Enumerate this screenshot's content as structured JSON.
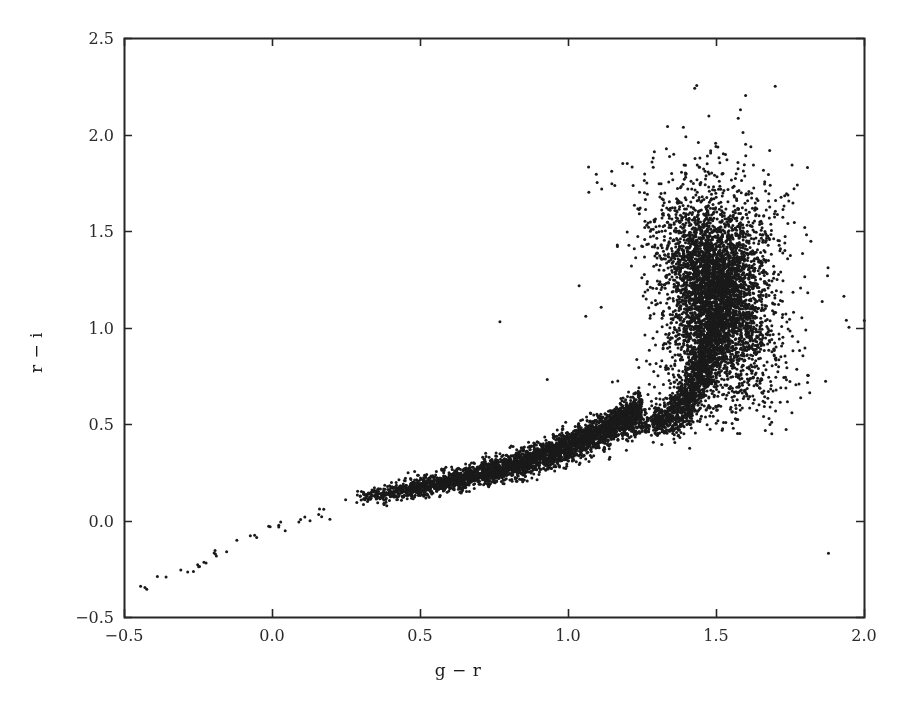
{
  "figure": {
    "background_color": "#ffffff",
    "axes_color": "#262626",
    "marker_color": "#1a1a1a",
    "plot_box": {
      "left": 124,
      "top": 38,
      "right": 864,
      "bottom": 617
    }
  },
  "chart_data": {
    "type": "scatter",
    "title": "",
    "subtitle": "",
    "xlabel": "g − r",
    "ylabel": "r − i",
    "xlim": [
      -0.5,
      2.0
    ],
    "ylim": [
      -0.5,
      2.5
    ],
    "xticks": [
      -0.5,
      0.0,
      0.5,
      1.0,
      1.5,
      2.0
    ],
    "xtick_labels": [
      "−0.5",
      "0.0",
      "0.5",
      "1.0",
      "1.5",
      "2.0"
    ],
    "yticks": [
      -0.5,
      0.0,
      0.5,
      1.0,
      1.5,
      2.0,
      2.5
    ],
    "ytick_labels": [
      "−0.5",
      "0.0",
      "0.5",
      "1.0",
      "1.5",
      "2.0",
      "2.5"
    ],
    "grid": false,
    "legend": null,
    "legend_position": "none",
    "marker": "circle",
    "marker_size_px": 3.0,
    "marker_color": "#1a1a1a",
    "n_points_approx": 9000,
    "annotations": [],
    "components": [
      {
        "name": "sparse-lower-tail",
        "n": 38,
        "x_range": [
          -0.46,
          0.28
        ],
        "y_range": [
          -0.35,
          0.12
        ],
        "slope": 0.63,
        "scatter_y": 0.03
      },
      {
        "name": "tight-main-locus",
        "n": 3600,
        "x_range": [
          0.28,
          1.25
        ],
        "y_range": [
          0.1,
          0.58
        ],
        "scatter_y": 0.035
      },
      {
        "name": "knee-transition",
        "n": 1400,
        "x_range": [
          1.18,
          1.48
        ],
        "y_range": [
          0.5,
          1.0
        ],
        "scatter_y": 0.06
      },
      {
        "name": "red-dwarf-blob",
        "n": 4200,
        "x_center": 1.5,
        "y_center": 1.18,
        "x_sigma": 0.075,
        "y_sigma": 0.26
      }
    ],
    "outliers": [
      {
        "x": 1.7,
        "y": 2.25
      },
      {
        "x": 1.6,
        "y": 1.95
      },
      {
        "x": 1.51,
        "y": 1.88
      },
      {
        "x": 1.37,
        "y": 1.72
      },
      {
        "x": 1.73,
        "y": 1.63
      },
      {
        "x": 1.26,
        "y": 1.55
      },
      {
        "x": 1.81,
        "y": 1.18
      },
      {
        "x": 1.79,
        "y": 1.05
      },
      {
        "x": 1.76,
        "y": 0.88
      },
      {
        "x": 0.77,
        "y": 1.03
      },
      {
        "x": 0.93,
        "y": 0.73
      },
      {
        "x": 1.88,
        "y": -0.17
      }
    ]
  }
}
